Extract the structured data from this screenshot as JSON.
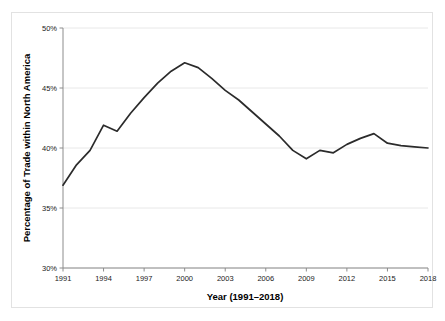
{
  "chart_data": {
    "type": "line",
    "title": "",
    "subtitle": "",
    "xlabel": "Year (1991–2018)",
    "ylabel": "Percentage of Trade within North America",
    "xlim": [
      1991,
      2018
    ],
    "ylim": [
      30,
      50
    ],
    "grid": true,
    "legend": null,
    "x_tick_labels": [
      "1991",
      "1994",
      "1997",
      "2000",
      "2003",
      "2006",
      "2009",
      "2012",
      "2015",
      "2018"
    ],
    "x_ticks": [
      1991,
      1994,
      1997,
      2000,
      2003,
      2006,
      2009,
      2012,
      2015,
      2018
    ],
    "y_tick_labels": [
      "30%",
      "35%",
      "40%",
      "45%",
      "50%"
    ],
    "y_ticks": [
      30,
      35,
      40,
      45,
      50
    ],
    "x": [
      1991,
      1992,
      1993,
      1994,
      1995,
      1996,
      1997,
      1998,
      1999,
      2000,
      2001,
      2002,
      2003,
      2004,
      2005,
      2006,
      2007,
      2008,
      2009,
      2010,
      2011,
      2012,
      2013,
      2014,
      2015,
      2016,
      2017,
      2018
    ],
    "values": [
      36.9,
      38.6,
      39.8,
      41.9,
      41.4,
      42.9,
      44.2,
      45.4,
      46.4,
      47.1,
      46.7,
      45.8,
      44.8,
      44.0,
      43.0,
      42.0,
      41.0,
      39.8,
      39.1,
      39.8,
      39.6,
      40.3,
      40.8,
      41.2,
      40.4,
      40.2,
      40.1,
      40.0
    ],
    "series": [
      {
        "name": "Percentage of Trade within North America",
        "color": "#2b2b2b",
        "values": [
          36.9,
          38.6,
          39.8,
          41.9,
          41.4,
          42.9,
          44.2,
          45.4,
          46.4,
          47.1,
          46.7,
          45.8,
          44.8,
          44.0,
          43.0,
          42.0,
          41.0,
          39.8,
          39.1,
          39.8,
          39.6,
          40.3,
          40.8,
          41.2,
          40.4,
          40.2,
          40.1,
          40.0
        ]
      }
    ],
    "colors": {
      "line": "#2b2b2b",
      "grid": "#e8e8e8",
      "axis": "#8c8c8c",
      "border": "#e2e2e2",
      "background": "#ffffff",
      "text": "#1a1a1a"
    }
  }
}
